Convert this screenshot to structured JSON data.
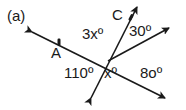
{
  "figure": {
    "panel_label": "(a)",
    "colors": {
      "line": "#1a1a1a",
      "background": "#ffffff"
    },
    "center": {
      "x": 108,
      "y": 61
    },
    "lines": [
      {
        "id": "line-through-A",
        "from": {
          "x": 32,
          "y": 32
        },
        "to": {
          "x": 165,
          "y": 98
        },
        "arrows": "both"
      },
      {
        "id": "line-through-C",
        "from": {
          "x": 91,
          "y": 98
        },
        "to": {
          "x": 137,
          "y": 7
        },
        "arrows": "both"
      },
      {
        "id": "ray-upper-right",
        "from": {
          "x": 108,
          "y": 61
        },
        "to": {
          "x": 169,
          "y": 28
        },
        "arrows": "end"
      }
    ],
    "points": [
      {
        "name": "A",
        "label": "A",
        "x": 59,
        "y": 42
      },
      {
        "name": "C",
        "label": "C",
        "x": 131,
        "y": 17
      }
    ],
    "angle_labels": {
      "top_left": "3xº",
      "top_right": "30º",
      "bottom_left": "110º",
      "bottom_center": "xº",
      "bottom_right": "8oº"
    }
  }
}
